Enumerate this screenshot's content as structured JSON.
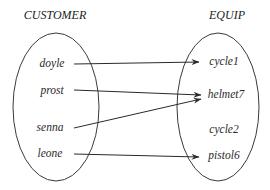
{
  "diagram": {
    "type": "set-mapping",
    "sets": {
      "left": {
        "title": "CUSTOMER",
        "elements": [
          "doyle",
          "prost",
          "senna",
          "leone"
        ]
      },
      "right": {
        "title": "EQUIP",
        "elements": [
          "cycle1",
          "helmet7",
          "cycle2",
          "pistol6"
        ]
      }
    },
    "mappings": [
      {
        "from": "doyle",
        "to": "cycle1"
      },
      {
        "from": "prost",
        "to": "helmet7"
      },
      {
        "from": "senna",
        "to": "helmet7"
      },
      {
        "from": "leone",
        "to": "pistol6"
      }
    ],
    "colors": {
      "line": "#2a2a2a",
      "text": "#2a2a2a",
      "background": "#ffffff"
    }
  }
}
